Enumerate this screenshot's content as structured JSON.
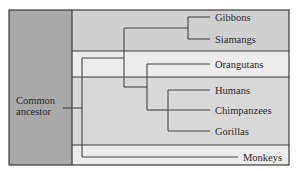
{
  "diagram": {
    "type": "phylogenetic-tree",
    "root": {
      "label_lines": [
        "Common",
        "ancestor"
      ]
    },
    "taxa": [
      {
        "name": "Gibbons",
        "group": "lesser-apes"
      },
      {
        "name": "Siamangs",
        "group": "lesser-apes"
      },
      {
        "name": "Orangutans",
        "group": "orangutans"
      },
      {
        "name": "Humans",
        "group": "african-hominids"
      },
      {
        "name": "Chimpanzees",
        "group": "african-hominids"
      },
      {
        "name": "Gorillas",
        "group": "african-hominids"
      },
      {
        "name": "Monkeys",
        "group": "monkeys"
      }
    ],
    "tree_newick": "(((Gibbons,Siamangs),(Orangutans,(Humans,Chimpanzees,Gorillas))),Monkeys)",
    "colors": {
      "ancestor_column": "#a9a9a9",
      "band_lesser_apes": "#cfcfcf",
      "band_orangutans": "#ececec",
      "band_african_hominids": "#d8d8d8",
      "band_monkeys": "#ececec",
      "line": "#444444"
    }
  }
}
